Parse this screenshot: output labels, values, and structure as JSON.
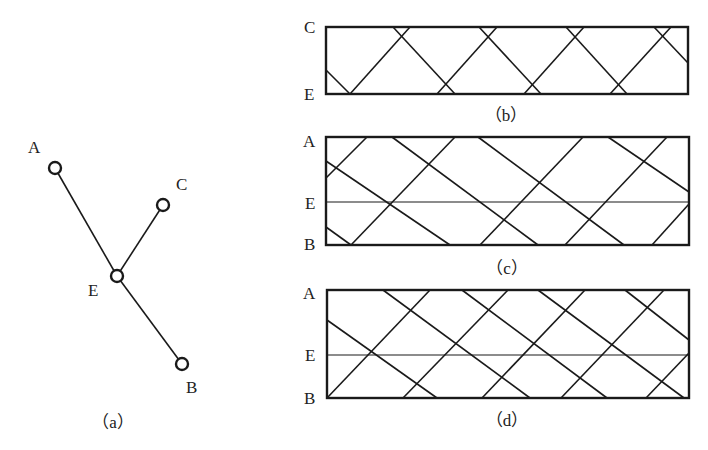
{
  "figure": {
    "panel_a": {
      "caption": "（a）",
      "nodes": [
        {
          "id": "A",
          "label": "A",
          "x": 55,
          "y": 168,
          "lx": 28,
          "ly": 153
        },
        {
          "id": "C",
          "label": "C",
          "x": 163,
          "y": 205,
          "lx": 176,
          "ly": 190
        },
        {
          "id": "E",
          "label": "E",
          "x": 117,
          "y": 276,
          "lx": 88,
          "ly": 296
        },
        {
          "id": "B",
          "label": "B",
          "x": 182,
          "y": 364,
          "lx": 186,
          "ly": 393
        }
      ],
      "edges": [
        [
          "A",
          "E"
        ],
        [
          "E",
          "B"
        ],
        [
          "E",
          "C"
        ]
      ]
    },
    "panel_b": {
      "caption": "（b）",
      "top_label": "C",
      "bottom_label": "E",
      "box": {
        "x1": 326,
        "y1": 27,
        "x2": 688,
        "y2": 94
      },
      "rays": [
        [
          326,
          70,
          350,
          94
        ],
        [
          350,
          94,
          410,
          27
        ],
        [
          393,
          27,
          455,
          94
        ],
        [
          437,
          94,
          497,
          27
        ],
        [
          479,
          27,
          541,
          94
        ],
        [
          524,
          94,
          584,
          27
        ],
        [
          566,
          27,
          627,
          94
        ],
        [
          610,
          94,
          671,
          27
        ],
        [
          654,
          27,
          688,
          63
        ]
      ]
    },
    "panel_c": {
      "caption": "（c）",
      "top_label": "A",
      "mid_label": "E",
      "bottom_label": "B",
      "box": {
        "x1": 326,
        "y1": 137,
        "x2": 689,
        "y2": 245
      },
      "e_line_y": 202,
      "rays": [
        [
          326,
          178,
          367,
          137
        ],
        [
          326,
          161,
          450,
          245
        ],
        [
          351,
          245,
          455,
          137
        ],
        [
          392,
          137,
          538,
          245
        ],
        [
          480,
          245,
          583,
          137
        ],
        [
          478,
          137,
          624,
          245
        ],
        [
          565,
          245,
          667,
          137
        ],
        [
          608,
          137,
          689,
          192
        ],
        [
          652,
          245,
          689,
          204
        ],
        [
          326,
          227,
          351,
          245
        ]
      ]
    },
    "panel_d": {
      "caption": "（d）",
      "top_label": "A",
      "mid_label": "E",
      "bottom_label": "B",
      "box": {
        "x1": 327,
        "y1": 290,
        "x2": 689,
        "y2": 398
      },
      "e_line_y": 355,
      "rays": [
        [
          327,
          320,
          437,
          398
        ],
        [
          327,
          398,
          430,
          290
        ],
        [
          383,
          290,
          530,
          398
        ],
        [
          403,
          398,
          508,
          290
        ],
        [
          462,
          290,
          607,
          398
        ],
        [
          482,
          398,
          585,
          290
        ],
        [
          538,
          290,
          684,
          398
        ],
        [
          561,
          398,
          664,
          290
        ],
        [
          625,
          290,
          689,
          340
        ],
        [
          646,
          398,
          689,
          353
        ]
      ]
    }
  }
}
